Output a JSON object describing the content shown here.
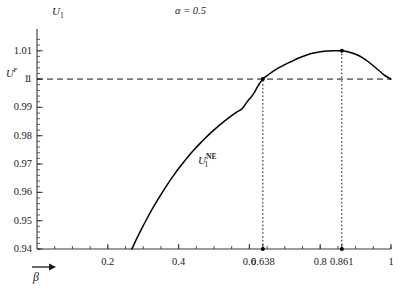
{
  "chart_data": {
    "type": "line",
    "title": "α = 0.5",
    "title_symbol": "α",
    "title_value": "= 0.5",
    "xlabel": "β",
    "ylabel": "U",
    "ylabel_sub": "1",
    "xlim": [
      0.0,
      1.0
    ],
    "ylim": [
      0.94,
      1.0145
    ],
    "grid": false,
    "legend": "none",
    "x_ticks": [
      {
        "value": 0.2,
        "label": "0.2"
      },
      {
        "value": 0.4,
        "label": "0.4"
      },
      {
        "value": 0.6,
        "label": "0.6"
      },
      {
        "value": 0.638,
        "label": "0.638"
      },
      {
        "value": 0.8,
        "label": "0.8"
      },
      {
        "value": 0.861,
        "label": "0.861"
      },
      {
        "value": 1.0,
        "label": "1"
      }
    ],
    "x_minor_tick_step": 0.05,
    "y_ticks": [
      {
        "value": 0.94,
        "label": "0.94"
      },
      {
        "value": 0.95,
        "label": "0.95"
      },
      {
        "value": 0.96,
        "label": "0.96"
      },
      {
        "value": 0.97,
        "label": "0.97"
      },
      {
        "value": 0.98,
        "label": "0.98"
      },
      {
        "value": 0.99,
        "label": "0.99"
      },
      {
        "value": 1.0,
        "label": "1"
      },
      {
        "value": 1.01,
        "label": "1.01"
      }
    ],
    "y_minor_tick_step": 0.002,
    "series": [
      {
        "name": "U_1^NE",
        "label_base": "U",
        "label_sub": "1",
        "label_sup": "NE",
        "style": "solid",
        "color": "#000000",
        "label_x": 0.455,
        "label_y": 0.9715,
        "points": [
          [
            0.268,
            0.94
          ],
          [
            0.28,
            0.9432
          ],
          [
            0.295,
            0.947
          ],
          [
            0.31,
            0.9506
          ],
          [
            0.325,
            0.954
          ],
          [
            0.34,
            0.9572
          ],
          [
            0.355,
            0.9602
          ],
          [
            0.37,
            0.9631
          ],
          [
            0.385,
            0.9658
          ],
          [
            0.4,
            0.9684
          ],
          [
            0.415,
            0.9708
          ],
          [
            0.43,
            0.9731
          ],
          [
            0.445,
            0.9752
          ],
          [
            0.46,
            0.9772
          ],
          [
            0.475,
            0.9791
          ],
          [
            0.49,
            0.9809
          ],
          [
            0.505,
            0.9826
          ],
          [
            0.52,
            0.9842
          ],
          [
            0.535,
            0.9857
          ],
          [
            0.55,
            0.9871
          ],
          [
            0.565,
            0.9884
          ],
          [
            0.58,
            0.9896
          ],
          [
            0.595,
            0.9922
          ],
          [
            0.61,
            0.9945
          ],
          [
            0.624,
            0.9975
          ],
          [
            0.638,
            1.0
          ],
          [
            0.655,
            1.0017
          ],
          [
            0.67,
            1.003
          ],
          [
            0.685,
            1.0041
          ],
          [
            0.7,
            1.0051
          ],
          [
            0.715,
            1.006
          ],
          [
            0.73,
            1.0069
          ],
          [
            0.745,
            1.0077
          ],
          [
            0.76,
            1.0084
          ],
          [
            0.775,
            1.009
          ],
          [
            0.79,
            1.0094
          ],
          [
            0.805,
            1.0097
          ],
          [
            0.82,
            1.0099
          ],
          [
            0.835,
            1.01
          ],
          [
            0.861,
            1.01
          ],
          [
            0.875,
            1.0097
          ],
          [
            0.89,
            1.0092
          ],
          [
            0.905,
            1.0085
          ],
          [
            0.92,
            1.0075
          ],
          [
            0.935,
            1.0062
          ],
          [
            0.95,
            1.0047
          ],
          [
            0.965,
            1.0031
          ],
          [
            0.98,
            1.0015
          ],
          [
            1.0,
            1.0
          ]
        ]
      }
    ],
    "reference_lines": [
      {
        "name": "U^F",
        "orientation": "horizontal",
        "value": 1.0,
        "style": "dashed",
        "label_base": "U",
        "label_sup": "F",
        "label_value": "1"
      },
      {
        "name": "beta-crossing",
        "orientation": "vertical",
        "value": 0.638,
        "style": "dotted",
        "from": 0.94,
        "to": 1.0
      },
      {
        "name": "beta-optimum",
        "orientation": "vertical",
        "value": 0.861,
        "style": "dotted",
        "from": 0.94,
        "to": 1.01
      }
    ],
    "markers": [
      {
        "name": "crossing-on-curve",
        "x": 0.638,
        "y": 1.0
      },
      {
        "name": "crossing-on-axis",
        "x": 0.638,
        "y": 0.94
      },
      {
        "name": "peak-on-curve",
        "x": 0.861,
        "y": 1.01
      },
      {
        "name": "peak-on-axis",
        "x": 0.861,
        "y": 0.94
      }
    ]
  }
}
